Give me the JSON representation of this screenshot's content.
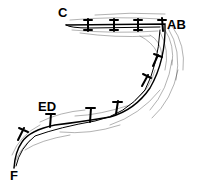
{
  "diagram": {
    "type": "suture-incision-sketch",
    "labels": {
      "c": "C",
      "ab": "AB",
      "ed": "ED",
      "f": "F"
    },
    "colors": {
      "ink": "#000000",
      "background": "#ffffff"
    },
    "segments": [
      {
        "from": "C",
        "to": "AB",
        "stitches": 4
      },
      {
        "from": "AB",
        "to": "ED",
        "stitches": 5
      },
      {
        "from": "ED",
        "to": "F",
        "stitches": 2
      }
    ]
  }
}
